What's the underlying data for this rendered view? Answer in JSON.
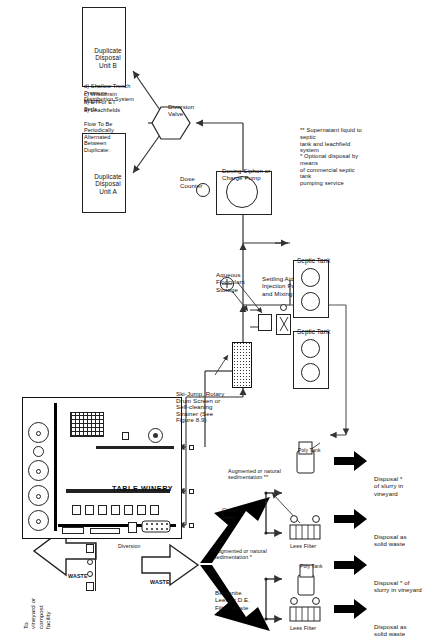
{
  "figure": {
    "building_label": "TABLE WINERY",
    "top_destination": "To\nvineyard or\ncompost\nfacility",
    "waste_arrow_top": "WASTE",
    "waste_arrow_left": "WASTE",
    "diversion_label": "Diversion",
    "cloud_label": "Pomace and\nstems from\ncrush pad"
  },
  "solids_stream": {
    "bentonite": "Bentonite\nLees or D.E.\nFilter Waste",
    "gross_lees": "Gross\nLees",
    "augmented_1": "Augmented or natural\nsedimentation *",
    "augmented_2": "Augmented or natural\nsedimentation **",
    "lees_filter_1": "Lees Filter",
    "lees_filter_2": "Lees Filter",
    "poly_tank_1": "Poly Tank",
    "poly_tank_2": "Poly Tank",
    "poly_tank_3": "Poly Tank"
  },
  "disposal_arrows": [
    {
      "label": "Disposal as\nsolid waste"
    },
    {
      "label": "Disposal * of\nslurry in vineyard"
    },
    {
      "label": "Disposal as\nsolid waste"
    },
    {
      "label": "Disposal *\nof slurry in\nvineyard"
    }
  ],
  "equipment": {
    "screen": "Ski-Jump, Rotary\nDrum Screen or\nSelf-cleaning\nStrainer (See\nFigure 8.9)",
    "flocculant": "Aqueous\nFlocculant\nStorage",
    "settling_pump": "Settling Aid\nInjection Pump\nand Mixing Tank",
    "septic_tank_1": "Septic Tank",
    "septic_tank_2": "Septic Tank",
    "dosing": "Dosing Siphon or\nCharge Pump",
    "dose_counter": "Dose\nCounter",
    "diversion_valve": "Diversion\nValve"
  },
  "disposal_units": {
    "unit_a": "Duplicate\nDisposal Unit A",
    "unit_b": "Duplicate\nDisposal Unit B",
    "note_heading": "Flow To Be Periodically\nAlternated Between\nDuplicate:",
    "note_items": [
      "a)  Leachfields",
      "b)  ETI or ET Beds",
      "c)  Wisconsin Mound",
      "d)  Shallow Trench Pressure\n      Distribution System"
    ]
  },
  "footnotes": [
    "*  Optional disposal by means\n   of commercial septic tank\n   pumping service",
    "** Supernatant liquid to septic\n   tank and leachfield system"
  ]
}
